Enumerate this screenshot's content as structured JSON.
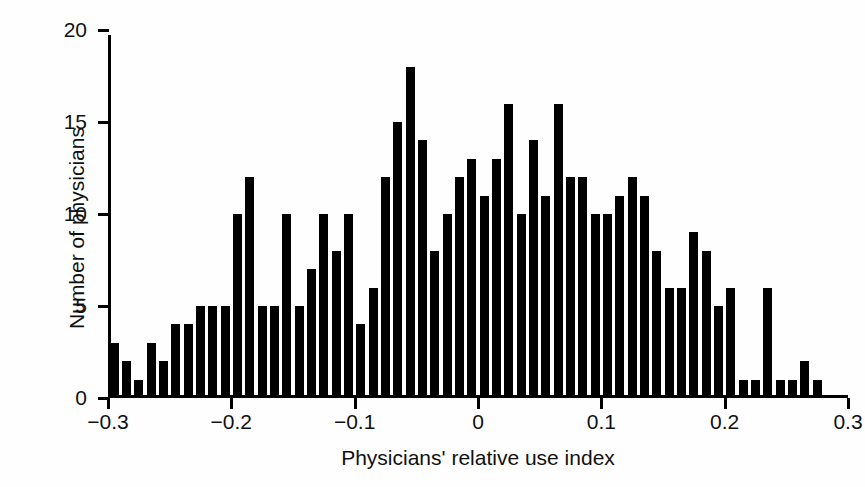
{
  "figure": {
    "top_artifact_text": "",
    "background_color": "#fefefe",
    "bar_color": "#000000",
    "axis_color": "#000000"
  },
  "chart_data": {
    "type": "bar",
    "title": "",
    "xlabel": "Physicians' relative use index",
    "ylabel": "Number of physicians",
    "xlim": [
      -0.3,
      0.3
    ],
    "ylim": [
      0,
      20
    ],
    "bin_width": 0.01,
    "grid": false,
    "legend": null,
    "xticks": [
      -0.3,
      -0.2,
      -0.1,
      0,
      0.1,
      0.2,
      0.3
    ],
    "xticklabels": [
      "−0.3",
      "−0.2",
      "−0.1",
      "0",
      "0.1",
      "0.2",
      "0.3"
    ],
    "yticks": [
      0,
      5,
      10,
      15,
      20
    ],
    "yticklabels": [
      "0",
      "5",
      "10",
      "15",
      "20"
    ],
    "categories": [
      "-0.30",
      "-0.29",
      "-0.28",
      "-0.27",
      "-0.26",
      "-0.25",
      "-0.24",
      "-0.23",
      "-0.22",
      "-0.21",
      "-0.20",
      "-0.19",
      "-0.18",
      "-0.17",
      "-0.16",
      "-0.15",
      "-0.14",
      "-0.13",
      "-0.12",
      "-0.11",
      "-0.10",
      "-0.09",
      "-0.08",
      "-0.07",
      "-0.06",
      "-0.05",
      "-0.04",
      "-0.03",
      "-0.02",
      "-0.01",
      "0.00",
      "0.01",
      "0.02",
      "0.03",
      "0.04",
      "0.05",
      "0.06",
      "0.07",
      "0.08",
      "0.09",
      "0.10",
      "0.11",
      "0.12",
      "0.13",
      "0.14",
      "0.15",
      "0.16",
      "0.17",
      "0.18",
      "0.19",
      "0.20",
      "0.21",
      "0.22",
      "0.23",
      "0.24",
      "0.25",
      "0.26",
      "0.27",
      "0.28",
      "0.29"
    ],
    "values": [
      3,
      2,
      1,
      3,
      2,
      4,
      4,
      5,
      5,
      5,
      10,
      12,
      5,
      5,
      10,
      5,
      7,
      10,
      8,
      10,
      4,
      6,
      12,
      15,
      18,
      14,
      8,
      10,
      12,
      13,
      11,
      13,
      16,
      10,
      14,
      11,
      16,
      12,
      12,
      10,
      10,
      11,
      12,
      11,
      8,
      6,
      6,
      9,
      8,
      5,
      6,
      1,
      1,
      6,
      1,
      1,
      2,
      1,
      0,
      0
    ]
  }
}
